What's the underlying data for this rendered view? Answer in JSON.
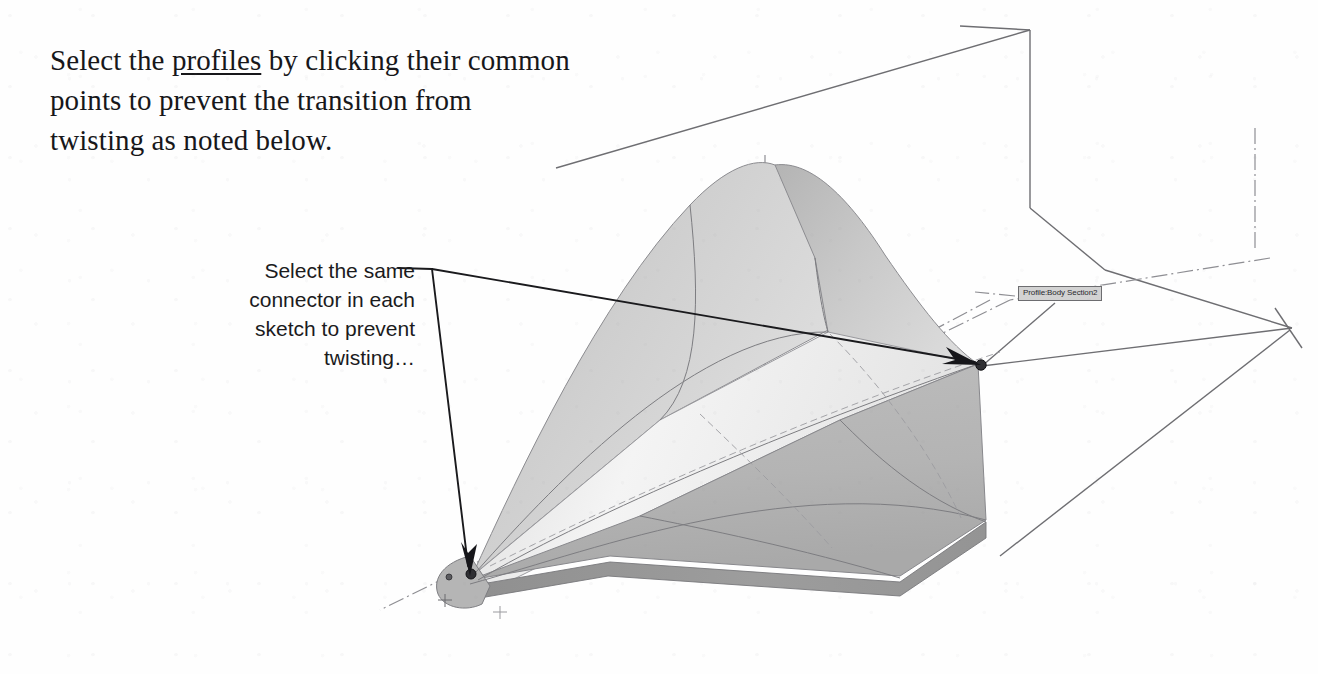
{
  "document": {
    "title": "Select the profiles by clicking their common points"
  },
  "heading": {
    "line1_pre": "Select the ",
    "line1_link": "profiles",
    "line1_post": " by clicking their common",
    "line2": "points to prevent the transition from",
    "line3": "twisting as noted below."
  },
  "callout": {
    "line1": "Select the same",
    "line2": "connector in each",
    "line3": "sketch to prevent",
    "line4": "twisting…"
  },
  "cad": {
    "tooltip_label": "Profile:Body Section2",
    "tooltip_icon": "selection-tag-icon",
    "arrow_target_left": "connector-point-left",
    "arrow_target_right": "connector-point-right",
    "model_name": "lofted-solid-body",
    "colors": {
      "line": "#3b3b3f",
      "line_light": "#9a9a9e",
      "centerline": "#8e8e93",
      "face_top_light": "#f2f2f2",
      "face_top_mid": "#d7d7d7",
      "face_upper": "#c9c9c9",
      "face_side": "#b6b6b6",
      "face_bottom": "#9d9d9d",
      "face_nose": "#c2c2c2",
      "tooltip_bg": "#d2d2d2",
      "tooltip_border": "#6d6d70",
      "text": "#17171a"
    },
    "annotations": [
      {
        "name": "leader-elbow",
        "kind": "leader-line"
      },
      {
        "name": "leader-branch-to-right-connector",
        "kind": "arrow"
      },
      {
        "name": "leader-branch-to-left-connector",
        "kind": "arrow"
      }
    ]
  }
}
